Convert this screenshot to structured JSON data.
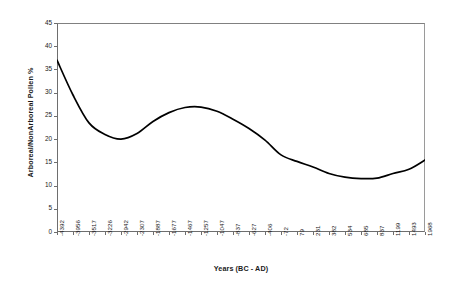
{
  "chart_data": {
    "type": "line",
    "title": "",
    "xlabel": "Years (BC - AD)",
    "ylabel": "Arboreal/NonArboreal Pollen %",
    "ylim": [
      0,
      45
    ],
    "ytick_labels": [
      "0",
      "5",
      "10",
      "15",
      "20",
      "25",
      "30",
      "35",
      "40",
      "45"
    ],
    "ytick_values": [
      0,
      5,
      10,
      15,
      20,
      25,
      30,
      35,
      40,
      45
    ],
    "grid": false,
    "legend": "none",
    "categories": [
      "-4392",
      "-3956",
      "-3517",
      "-3226",
      "-2942",
      "-2307",
      "-1887",
      "-1677",
      "-1467",
      "-1257",
      "-1047",
      "-837",
      "-627",
      "-406",
      "-72",
      "79",
      "231",
      "382",
      "534",
      "685",
      "837",
      "1199",
      "1493",
      "1968"
    ],
    "x": [
      -4392,
      -3956,
      -3517,
      -3226,
      -2942,
      -2307,
      -1887,
      -1677,
      -1467,
      -1257,
      -1047,
      -837,
      -627,
      -406,
      -72,
      79,
      231,
      382,
      534,
      685,
      837,
      1199,
      1493,
      1968
    ],
    "values": [
      37.0,
      29.5,
      23.5,
      21.0,
      20.0,
      21.2,
      23.8,
      25.7,
      26.8,
      26.9,
      26.0,
      24.3,
      22.3,
      19.8,
      16.6,
      15.2,
      14.0,
      12.6,
      11.8,
      11.5,
      11.6,
      12.6,
      13.5,
      15.5
    ],
    "series_name": "Arboreal/NonArboreal Pollen %",
    "line_color": "#000000",
    "line_width": 1.6,
    "markers": "none"
  },
  "axes": {
    "frame_color": "#808080",
    "tick_color": "#6e6e6e",
    "background": "#ffffff"
  }
}
